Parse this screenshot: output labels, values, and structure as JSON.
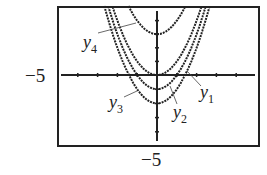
{
  "chart_data": {
    "type": "line",
    "title": "",
    "xlabel": "",
    "ylabel": "",
    "xlim": [
      -5,
      5
    ],
    "ylim": [
      -5,
      5
    ],
    "grid": false,
    "axis_labels": {
      "x_min": "−5",
      "y_min": "−5"
    },
    "series": [
      {
        "name": "y1",
        "expression": "x^2",
        "shift": 0
      },
      {
        "name": "y2",
        "expression": "x^2 - 1",
        "shift": -1
      },
      {
        "name": "y3",
        "expression": "x^2 - 2",
        "shift": -2
      },
      {
        "name": "y4",
        "expression": "x^2 + 3",
        "shift": 3
      }
    ],
    "legend": "inline labels with leader lines"
  },
  "labels": {
    "left": "−5",
    "bottom": "−5",
    "y1": "y",
    "y1_sub": "1",
    "y2": "y",
    "y2_sub": "2",
    "y3": "y",
    "y3_sub": "3",
    "y4": "y",
    "y4_sub": "4"
  }
}
